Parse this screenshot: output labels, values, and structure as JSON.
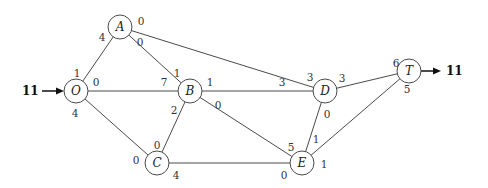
{
  "diagram": {
    "type": "network-flow",
    "source_flow": "11",
    "sink_flow": "11",
    "nodes": [
      {
        "id": "O",
        "label": "O",
        "x": 76,
        "y": 91
      },
      {
        "id": "A",
        "label": "A",
        "x": 120,
        "y": 27
      },
      {
        "id": "B",
        "label": "B",
        "x": 190,
        "y": 91
      },
      {
        "id": "C",
        "label": "C",
        "x": 157,
        "y": 163
      },
      {
        "id": "D",
        "label": "D",
        "x": 325,
        "y": 91
      },
      {
        "id": "E",
        "label": "E",
        "x": 302,
        "y": 163
      },
      {
        "id": "T",
        "label": "T",
        "x": 409,
        "y": 71
      }
    ],
    "edges": [
      {
        "from": "O",
        "to": "A",
        "label_from": "1",
        "label_to": "4"
      },
      {
        "from": "O",
        "to": "B",
        "label_from": "0",
        "label_to": "7"
      },
      {
        "from": "O",
        "to": "C",
        "label_from": "4",
        "label_to": "0"
      },
      {
        "from": "A",
        "to": "B",
        "label_from": "0",
        "label_to": "1"
      },
      {
        "from": "A",
        "to": "D",
        "label_from": "0",
        "label_to": "3"
      },
      {
        "from": "B",
        "to": "D",
        "label_from": "1",
        "label_to": "3"
      },
      {
        "from": "B",
        "to": "C",
        "label_from": "2",
        "label_to": "0"
      },
      {
        "from": "B",
        "to": "E",
        "label_from": "0",
        "label_to": "5"
      },
      {
        "from": "C",
        "to": "E",
        "label_from": "4",
        "label_to": "0"
      },
      {
        "from": "D",
        "to": "T",
        "label_from": "3",
        "label_to": "6"
      },
      {
        "from": "D",
        "to": "E",
        "label_from": "0",
        "label_to": "1"
      },
      {
        "from": "E",
        "to": "T",
        "label_from": "1",
        "label_to": "5"
      }
    ]
  }
}
